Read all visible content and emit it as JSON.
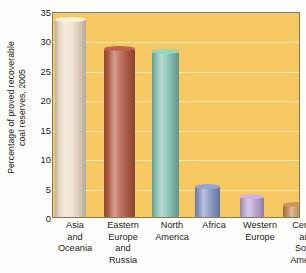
{
  "chart_data": {
    "type": "bar",
    "title": "",
    "subtitle": "",
    "xlabel": "",
    "ylabel": "Percentage of proved recoverable\ncoal reserves, 2005",
    "categories": [
      "Asia\nand\nOceania",
      "Eastern\nEurope\nand\nRussia",
      "North\nAmerica",
      "Africa",
      "Western\nEurope",
      "Central\nand\nSouth\nAmerica"
    ],
    "values": [
      33.8,
      28.8,
      28.3,
      5.3,
      3.5,
      2.1
    ],
    "ylim": [
      0,
      35
    ],
    "yticks": [
      0,
      5,
      10,
      15,
      20,
      25,
      30,
      35
    ],
    "ytick_labels": [
      "0",
      "5",
      "10",
      "15",
      "20",
      "25",
      "30",
      "35"
    ],
    "grid": true,
    "legend": false,
    "bar_colors": [
      "#f0e0cc",
      "#b35c45",
      "#87c4b6",
      "#8a99c8",
      "#bda8d4",
      "#c08a56"
    ],
    "plot_background": "#f5c862",
    "axis_color": "#8a7a52"
  }
}
